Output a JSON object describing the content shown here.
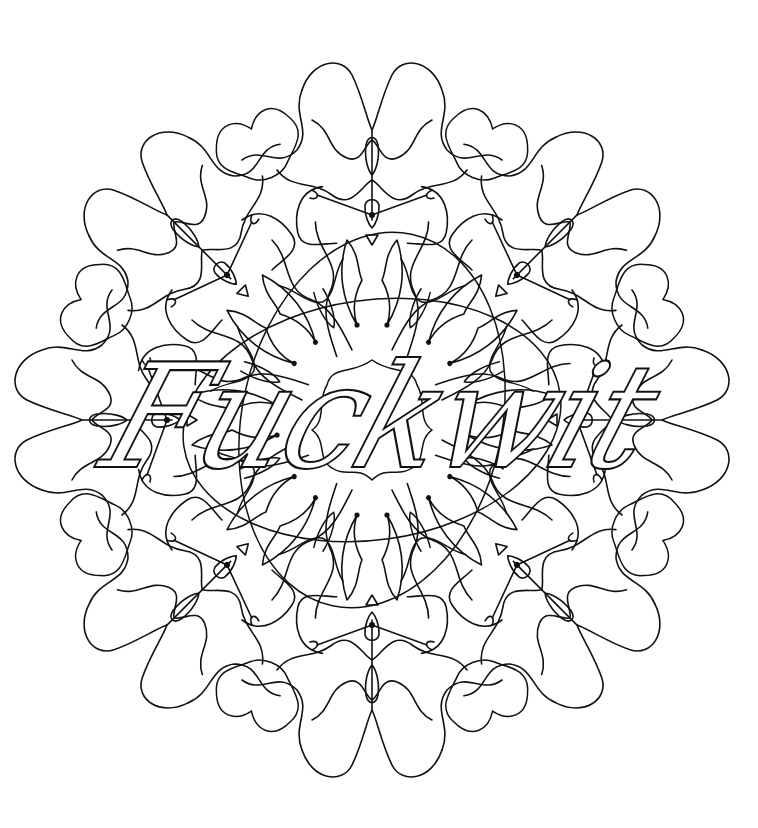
{
  "page": {
    "background": "#ffffff",
    "line_color": "#111111"
  },
  "artwork": {
    "type": "mandala-coloring-page",
    "center_text": "Fuckwit",
    "symmetry_folds": 8
  }
}
